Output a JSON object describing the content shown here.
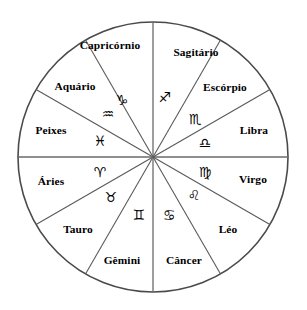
{
  "figure": {
    "kind": "zodiac-wheel",
    "background_color": "#ffffff",
    "stroke_color": "#4a4a4a",
    "text_color": "#000000",
    "center_x": 153,
    "center_y": 157,
    "radius": 135,
    "wedge_count": 12,
    "wedge_degrees": 30
  },
  "signs": [
    {
      "name": "Capricórnio",
      "glyph": "♑",
      "glyph_name": "capricorn-glyph",
      "start_angle": 90,
      "end_angle": 120,
      "label_x": 110,
      "label_y": 49,
      "glyph_x": 122,
      "glyph_y": 105
    },
    {
      "name": "Sagitário",
      "glyph": "♐",
      "glyph_name": "sagittarius-glyph",
      "start_angle": 60,
      "end_angle": 90,
      "label_x": 196,
      "label_y": 56,
      "glyph_x": 165,
      "glyph_y": 102
    },
    {
      "name": "Escórpio",
      "glyph": "♏",
      "glyph_name": "scorpio-glyph",
      "start_angle": 30,
      "end_angle": 60,
      "label_x": 225,
      "label_y": 91,
      "glyph_x": 195,
      "glyph_y": 124
    },
    {
      "name": "Libra",
      "glyph": "♎",
      "glyph_name": "libra-glyph",
      "start_angle": 0,
      "end_angle": 30,
      "label_x": 254,
      "label_y": 134,
      "glyph_x": 205,
      "glyph_y": 148
    },
    {
      "name": "Virgo",
      "glyph": "♍",
      "glyph_name": "virgo-glyph",
      "start_angle": -30,
      "end_angle": 0,
      "label_x": 253,
      "label_y": 183,
      "glyph_x": 205,
      "glyph_y": 177
    },
    {
      "name": "Léo",
      "glyph": "♌",
      "glyph_name": "leo-glyph",
      "start_angle": -60,
      "end_angle": -30,
      "label_x": 228,
      "label_y": 233,
      "glyph_x": 194,
      "glyph_y": 200
    },
    {
      "name": "Câncer",
      "glyph": "♋",
      "glyph_name": "cancer-glyph",
      "start_angle": -90,
      "end_angle": -60,
      "label_x": 184,
      "label_y": 264,
      "glyph_x": 169,
      "glyph_y": 220
    },
    {
      "name": "Gêmini",
      "glyph": "♊",
      "glyph_name": "gemini-glyph",
      "start_angle": -120,
      "end_angle": -90,
      "label_x": 122,
      "label_y": 264,
      "glyph_x": 139,
      "glyph_y": 220
    },
    {
      "name": "Tauro",
      "glyph": "♉",
      "glyph_name": "taurus-glyph",
      "start_angle": -150,
      "end_angle": -120,
      "label_x": 78,
      "label_y": 233,
      "glyph_x": 111,
      "glyph_y": 202
    },
    {
      "name": "Áries",
      "glyph": "♈",
      "glyph_name": "aries-glyph",
      "start_angle": 180,
      "end_angle": -150,
      "label_x": 51,
      "label_y": 185,
      "glyph_x": 100,
      "glyph_y": 177
    },
    {
      "name": "Peixes",
      "glyph": "♓",
      "glyph_name": "pisces-glyph",
      "start_angle": 150,
      "end_angle": 180,
      "label_x": 51,
      "label_y": 134,
      "glyph_x": 100,
      "glyph_y": 146
    },
    {
      "name": "Aquário",
      "glyph": "♒",
      "glyph_name": "aquarius-glyph",
      "start_angle": 120,
      "end_angle": 150,
      "label_x": 75,
      "label_y": 90,
      "glyph_x": 108,
      "glyph_y": 119
    }
  ]
}
